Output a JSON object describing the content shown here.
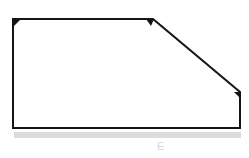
{
  "diagram": {
    "type": "pentagon-outline",
    "colors": {
      "stroke": "#151515",
      "shadow_band": "#dcdcdc",
      "label": "#d4d4d4"
    },
    "vertices": [
      {
        "x": 13,
        "y": 19
      },
      {
        "x": 153,
        "y": 19
      },
      {
        "x": 240,
        "y": 92
      },
      {
        "x": 240,
        "y": 128
      },
      {
        "x": 13,
        "y": 128
      }
    ],
    "arrowheads": [
      {
        "at": "top-left",
        "x": 13,
        "y": 19
      },
      {
        "at": "top-middle",
        "x": 153,
        "y": 19
      },
      {
        "at": "right",
        "x": 240,
        "y": 92
      }
    ],
    "bottom_label": "E"
  }
}
